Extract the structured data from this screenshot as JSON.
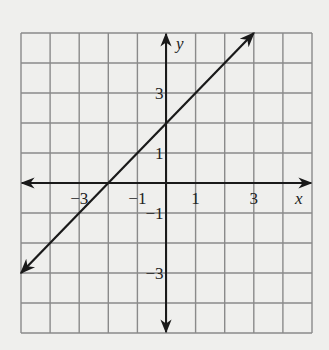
{
  "chart_data": {
    "type": "line",
    "title": "",
    "xlabel": "x",
    "ylabel": "y",
    "xlim": [
      -5,
      5
    ],
    "ylim": [
      -5,
      5
    ],
    "grid": true,
    "grid_step": 1,
    "x_tick_labels": [
      "−3",
      "−1",
      "1",
      "3"
    ],
    "x_ticks": [
      -3,
      -1,
      1,
      3
    ],
    "y_tick_labels": [
      "3",
      "1",
      "−1",
      "−3"
    ],
    "y_ticks": [
      3,
      1,
      -1,
      -3
    ],
    "series": [
      {
        "name": "y = x + 2",
        "equation": "y = x + 2",
        "slope": 1,
        "intercept": 2,
        "x": [
          -5,
          -2,
          0,
          3
        ],
        "y": [
          -3,
          0,
          2,
          5
        ],
        "arrows_both_ends": true
      }
    ],
    "colors": {
      "grid": "#8a8a8a",
      "axis": "#1a1a1a",
      "line": "#1a1a1a",
      "background": "#efefed"
    }
  }
}
